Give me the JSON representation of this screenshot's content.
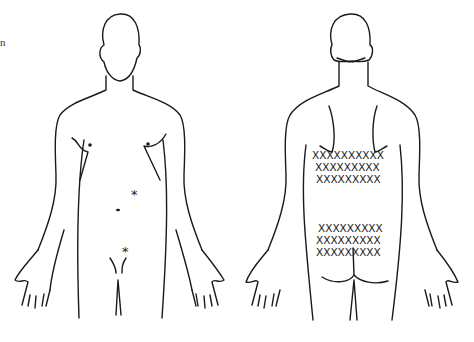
{
  "figure": {
    "text_fragment": "n",
    "front_view": {
      "label": "front body outline",
      "markers": [
        {
          "type": "asterisk",
          "symbol": "*",
          "x": 135,
          "y": 197
        },
        {
          "type": "dot",
          "x": 119,
          "y": 210
        },
        {
          "type": "asterisk",
          "symbol": "*",
          "x": 127,
          "y": 254
        }
      ]
    },
    "back_view": {
      "label": "back body outline",
      "mark_symbol": "X",
      "upper_block": {
        "rows": [
          10,
          9,
          9
        ]
      },
      "lower_block": {
        "rows": [
          9,
          9,
          9
        ]
      }
    },
    "colors": {
      "line": "#1a1a1a",
      "background": "#ffffff"
    }
  }
}
